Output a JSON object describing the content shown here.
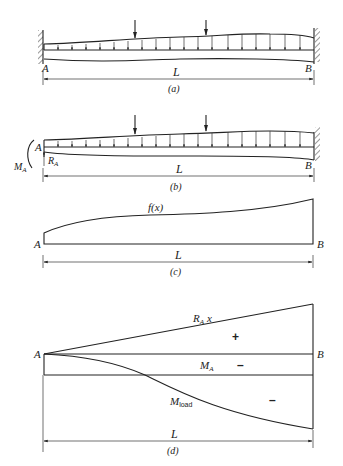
{
  "figure": {
    "panels": [
      {
        "id": "a",
        "caption": "(a)",
        "left_label": "A",
        "right_label": "B",
        "span_label": "L",
        "description": "Fixed-fixed beam with distributed load and two point loads"
      },
      {
        "id": "b",
        "caption": "(b)",
        "left_label": "A",
        "right_label": "B",
        "span_label": "L",
        "reaction_label": "R",
        "reaction_sub": "A",
        "moment_label": "M",
        "moment_sub": "A",
        "description": "Cantilever with redundant reaction R_A and moment M_A at A"
      },
      {
        "id": "c",
        "caption": "(c)",
        "left_label": "A",
        "right_label": "B",
        "span_label": "L",
        "curve_label": "f(x)",
        "description": "Load distribution f(x)"
      },
      {
        "id": "d",
        "caption": "(d)",
        "left_label": "A",
        "right_label": "B",
        "span_label": "L",
        "ra_label": "R",
        "ra_sub": "A",
        "ra_x": "x",
        "ma_label": "M",
        "ma_sub": "A",
        "mload_label": "M",
        "mload_sub": "load",
        "plus_sign": "+",
        "minus_sign_1": "–",
        "minus_sign_2": "–",
        "description": "Moment diagrams by parts"
      }
    ]
  }
}
